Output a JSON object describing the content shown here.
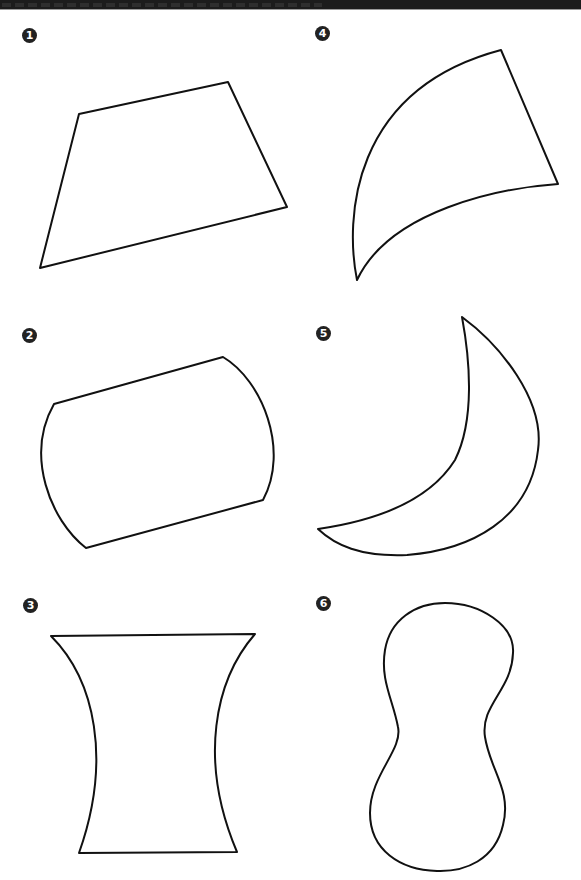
{
  "header": {
    "text_visible": false
  },
  "figures": [
    {
      "number": "1",
      "shape": "quadrilateral"
    },
    {
      "number": "2",
      "shape": "curved-side-parallelogram"
    },
    {
      "number": "3",
      "shape": "concave-sided-trapezoid"
    },
    {
      "number": "4",
      "shape": "curved-triangle"
    },
    {
      "number": "5",
      "shape": "crescent"
    },
    {
      "number": "6",
      "shape": "peanut"
    }
  ],
  "colors": {
    "stroke": "#111111",
    "marker_fill": "#222222",
    "header": "#1c1c1c"
  }
}
